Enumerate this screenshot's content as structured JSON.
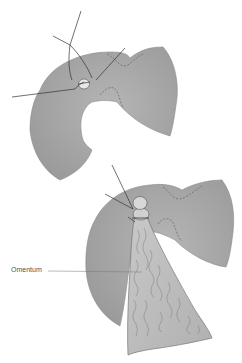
{
  "figure": {
    "panels": [
      {
        "id": "top",
        "description": "Stomach with suture ligation at perforation site"
      },
      {
        "id": "bottom",
        "description": "Stomach with omentum tied over closure"
      }
    ],
    "labels": {
      "omentum": "Omentum"
    },
    "colors": {
      "stomach_fill": "#a3a3a3",
      "stomach_highlight": "#b8b8b8",
      "omentum_fill": "#bdbdbd",
      "line": "#333333",
      "background": "#ffffff"
    }
  }
}
